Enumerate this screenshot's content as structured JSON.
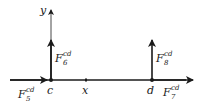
{
  "diagram": {
    "axes": {
      "x_label": "x",
      "y_label": "y"
    },
    "points": [
      {
        "id": "c",
        "label": "c"
      },
      {
        "id": "d",
        "label": "d"
      }
    ],
    "forces": [
      {
        "id": "F5",
        "base": "F",
        "sub": "5",
        "sup": "cd",
        "direction": "right",
        "at": "c"
      },
      {
        "id": "F6",
        "base": "F",
        "sub": "6",
        "sup": "cd",
        "direction": "up",
        "at": "c"
      },
      {
        "id": "F7",
        "base": "F",
        "sub": "7",
        "sup": "cd",
        "direction": "right",
        "at": "d"
      },
      {
        "id": "F8",
        "base": "F",
        "sub": "8",
        "sup": "cd",
        "direction": "up",
        "at": "d"
      }
    ],
    "colors": {
      "line": "#1a1a1a",
      "background": "#ffffff"
    }
  }
}
